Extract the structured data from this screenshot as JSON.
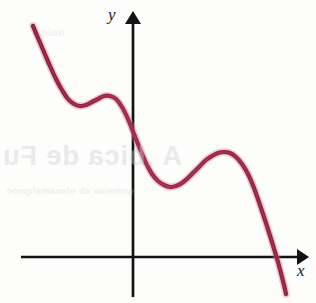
{
  "figure": {
    "kind": "cartesian-graph",
    "background_color": "#fdfdfc",
    "axis_color": "#121212",
    "curve_color": "#9c2240",
    "curve_color_highlight": "#b8566f",
    "curve_stroke_width": 4.2,
    "axis_stroke_width": 2.6
  },
  "axes": {
    "x_label": "x",
    "y_label": "y",
    "origin_px": {
      "x": 133,
      "y": 257
    },
    "x_axis_start_px": 21,
    "x_axis_end_px": 307,
    "y_axis_top_px": 12,
    "y_axis_bottom_px": 297
  },
  "artifacts": {
    "bleed_through_1": "A .bica de Fu",
    "bleed_through_2": "gnmoiav ab oianamalqmoo",
    "bleed_through_3": "oaiq"
  },
  "chart_data": {
    "type": "line",
    "title": "",
    "subtitle": "",
    "xlabel": "x",
    "ylabel": "y",
    "grid": false,
    "legend": null,
    "xlim": [
      -3.2,
      4.1
    ],
    "ylim": [
      -3.1,
      6.2
    ],
    "series": [
      {
        "name": "f(x)",
        "stroke": "#9c2240",
        "points_px": [
          [
            33,
            26
          ],
          [
            38,
            38
          ],
          [
            44,
            52
          ],
          [
            50,
            66
          ],
          [
            56,
            79
          ],
          [
            62,
            90
          ],
          [
            68,
            99
          ],
          [
            74,
            104
          ],
          [
            80,
            106
          ],
          [
            86,
            105
          ],
          [
            92,
            102
          ],
          [
            98,
            99
          ],
          [
            104,
            96
          ],
          [
            110,
            96
          ],
          [
            116,
            99
          ],
          [
            122,
            107
          ],
          [
            128,
            119
          ],
          [
            134,
            134
          ],
          [
            140,
            149
          ],
          [
            146,
            163
          ],
          [
            152,
            174
          ],
          [
            158,
            181
          ],
          [
            164,
            185
          ],
          [
            170,
            187
          ],
          [
            176,
            186
          ],
          [
            182,
            183
          ],
          [
            188,
            178
          ],
          [
            194,
            172
          ],
          [
            200,
            166
          ],
          [
            206,
            160
          ],
          [
            212,
            156
          ],
          [
            218,
            153
          ],
          [
            224,
            152
          ],
          [
            230,
            153
          ],
          [
            236,
            157
          ],
          [
            242,
            164
          ],
          [
            248,
            174
          ],
          [
            254,
            188
          ],
          [
            260,
            205
          ],
          [
            266,
            223
          ],
          [
            272,
            242
          ],
          [
            278,
            262
          ],
          [
            284,
            285
          ],
          [
            286,
            294
          ]
        ],
        "x": [
          -3.0,
          -2.75,
          -2.5,
          -2.25,
          -2.0,
          -1.75,
          -1.5,
          -1.25,
          -1.0,
          -0.75,
          -0.5,
          -0.25,
          0.0,
          0.25,
          0.5,
          0.75,
          1.0,
          1.25,
          1.5,
          1.75,
          2.0,
          2.25,
          2.5,
          2.75,
          3.0,
          3.25,
          3.5,
          3.75,
          4.0
        ],
        "y": [
          5.05,
          4.15,
          3.2,
          2.35,
          1.7,
          1.35,
          1.25,
          1.4,
          1.6,
          1.62,
          1.3,
          0.7,
          0.0,
          -0.75,
          -1.4,
          -1.85,
          -2.05,
          -2.0,
          -1.75,
          -1.45,
          -1.2,
          -1.05,
          -1.05,
          -1.25,
          -1.7,
          -2.4,
          -3.3,
          -4.4,
          -5.6
        ]
      }
    ],
    "features": [
      {
        "name": "local-minimum-1",
        "x_px": 80,
        "y_px": 106
      },
      {
        "name": "local-maximum-1",
        "x_px": 108,
        "y_px": 96
      },
      {
        "name": "y-intercept",
        "x_px": 133,
        "y_px": 134
      },
      {
        "name": "local-minimum-2",
        "x_px": 174,
        "y_px": 187
      },
      {
        "name": "local-maximum-2",
        "x_px": 225,
        "y_px": 152
      },
      {
        "name": "x-intercept",
        "x_px": 276,
        "y_px": 257
      }
    ]
  }
}
